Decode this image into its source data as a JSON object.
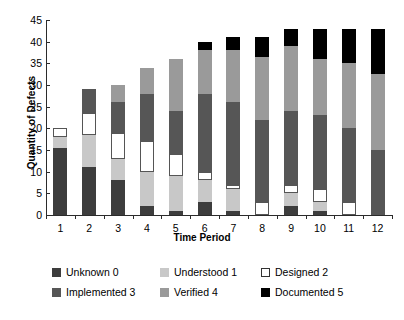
{
  "chart_data": {
    "type": "bar",
    "stacked": true,
    "title": "",
    "xlabel": "Time Period",
    "ylabel": "Quantity of Defects",
    "ylim": [
      0,
      45
    ],
    "yticks": [
      0,
      5,
      10,
      15,
      20,
      25,
      30,
      35,
      40,
      45
    ],
    "grid": false,
    "legend_position": "bottom",
    "categories": [
      "1",
      "2",
      "3",
      "4",
      "5",
      "6",
      "7",
      "8",
      "9",
      "10",
      "11",
      "12"
    ],
    "series": [
      {
        "name": "Unknown 0",
        "color": "#3d3d3d",
        "values": [
          15.5,
          11,
          8,
          2,
          1,
          3,
          1,
          0,
          2,
          1,
          0,
          0
        ]
      },
      {
        "name": "Understood 1",
        "color": "#c8c8c8",
        "values": [
          2.5,
          7.5,
          5,
          8,
          8,
          5,
          5,
          0,
          3,
          2,
          0,
          0
        ]
      },
      {
        "name": "Designed 2",
        "color": "#ffffff",
        "values": [
          2,
          5,
          6,
          7,
          5,
          2,
          1,
          3,
          2,
          3,
          3,
          0
        ]
      },
      {
        "name": "Implemented 3",
        "color": "#565656",
        "values": [
          0,
          5.5,
          7,
          11,
          10,
          18,
          19,
          19,
          17,
          17,
          17,
          15
        ]
      },
      {
        "name": "Verified 4",
        "color": "#9a9a9a",
        "values": [
          0,
          0,
          4,
          6,
          12,
          10,
          12,
          14.5,
          15,
          13,
          15,
          17.5
        ]
      },
      {
        "name": "Documented 5",
        "color": "#000000",
        "values": [
          0,
          0,
          0,
          0,
          0,
          2,
          3,
          4.5,
          4,
          7,
          8,
          10.5
        ]
      }
    ],
    "totals": [
      20,
      29,
      30,
      34,
      36,
      40,
      41,
      41,
      43,
      43,
      43,
      43
    ]
  },
  "legend": {
    "items": [
      {
        "label": "Unknown 0",
        "swatch": "s0"
      },
      {
        "label": "Understood 1",
        "swatch": "s1"
      },
      {
        "label": "Designed 2",
        "swatch": "s2"
      },
      {
        "label": "Implemented 3",
        "swatch": "s3"
      },
      {
        "label": "Verified 4",
        "swatch": "s4"
      },
      {
        "label": "Documented 5",
        "swatch": "s5"
      }
    ]
  },
  "colors": {
    "axis": "#2b2b2b",
    "background": "#ffffff",
    "text": "#000000"
  }
}
